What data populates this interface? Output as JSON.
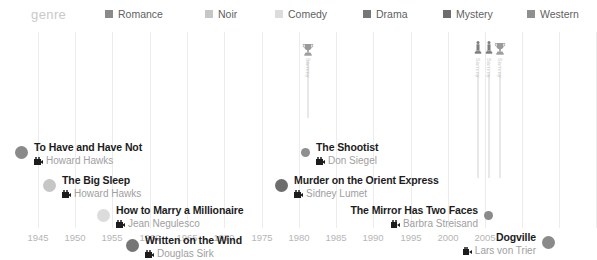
{
  "legend": {
    "title": "genre",
    "items": [
      {
        "label": "Romance",
        "color": "#8a8a8a",
        "x": 105
      },
      {
        "label": "Noir",
        "color": "#c6c6c6",
        "x": 205
      },
      {
        "label": "Comedy",
        "color": "#dcdcdc",
        "x": 275
      },
      {
        "label": "Drama",
        "color": "#767676",
        "x": 363
      },
      {
        "label": "Mystery",
        "color": "#6d6d6d",
        "x": 443
      },
      {
        "label": "Western",
        "color": "#8f8f8f",
        "x": 527
      }
    ]
  },
  "axis": {
    "ticks": [
      {
        "label": "1945",
        "x": 38
      },
      {
        "label": "1950",
        "x": 75
      },
      {
        "label": "1955",
        "x": 112
      },
      {
        "label": "1960",
        "x": 150
      },
      {
        "label": "1965",
        "x": 187
      },
      {
        "label": "1970",
        "x": 224
      },
      {
        "label": "1975",
        "x": 262
      },
      {
        "label": "1980",
        "x": 299
      },
      {
        "label": "1985",
        "x": 336
      },
      {
        "label": "1990",
        "x": 373
      },
      {
        "label": "1995",
        "x": 411
      },
      {
        "label": "2000",
        "x": 448
      },
      {
        "label": "2005",
        "x": 485
      }
    ],
    "gridlines": [
      38,
      75,
      112,
      150,
      187,
      224,
      262,
      299,
      336,
      373,
      411,
      448,
      485,
      522,
      559,
      596
    ],
    "range": [
      1945,
      2005
    ]
  },
  "chart_data": {
    "type": "scatter",
    "title": "",
    "xlabel": "",
    "ylabel": "",
    "xlim": [
      1945,
      2005
    ],
    "grid": true,
    "legend_position": "top",
    "films": [
      {
        "title": "To Have and Have Not",
        "director": "Howard Hawks",
        "year": 1944,
        "genre": "Romance",
        "color": "#8a8a8a",
        "dot_x": 22,
        "dot_y": 117,
        "label_side": "right",
        "dot_size": "large"
      },
      {
        "title": "The Big Sleep",
        "director": "Howard Hawks",
        "year": 1946,
        "genre": "Noir",
        "color": "#c6c6c6",
        "dot_x": 50,
        "dot_y": 150,
        "label_side": "right",
        "dot_size": "large"
      },
      {
        "title": "How to Marry a Millionaire",
        "director": "Jean Negulesco",
        "year": 1953,
        "genre": "Comedy",
        "color": "#dcdcdc",
        "dot_x": 104,
        "dot_y": 180,
        "label_side": "right",
        "dot_size": "large"
      },
      {
        "title": "Written on the Wind",
        "director": "Douglas Sirk",
        "year": 1956,
        "genre": "Drama",
        "color": "#767676",
        "dot_x": 133,
        "dot_y": 210,
        "label_side": "right",
        "dot_size": "large"
      },
      {
        "title": "The Shootist",
        "director": "Don Siegel",
        "year": 1976,
        "genre": "Western",
        "color": "#8f8f8f",
        "dot_x": 308,
        "dot_y": 117,
        "label_side": "right",
        "dot_size": "small"
      },
      {
        "title": "Murder on the Orient Express",
        "director": "Sidney Lumet",
        "year": 1974,
        "genre": "Mystery",
        "color": "#6d6d6d",
        "dot_x": 282,
        "dot_y": 150,
        "label_side": "right",
        "dot_size": "large"
      },
      {
        "title": "The Mirror Has Two Faces",
        "director": "Barbra Streisand",
        "year": 1996,
        "genre": "Romance",
        "color": "#8a8a8a",
        "dot_x": 486,
        "dot_y": 180,
        "label_side": "left",
        "dot_size": "small"
      },
      {
        "title": "Dogville",
        "director": "Lars von Trier",
        "year": 2003,
        "genre": "Drama",
        "color": "#8a8a8a",
        "dot_x": 548,
        "dot_y": 207,
        "label_side": "left",
        "dot_size": "large"
      }
    ],
    "awards": [
      {
        "icon": "trophy",
        "label": "Sammy",
        "x": 308,
        "icon_top": 10,
        "text_top": 26,
        "stem_top": 28,
        "stem_height": 58
      },
      {
        "icon": "statuette",
        "label": "Sammy",
        "x": 478,
        "icon_top": 8,
        "text_top": 26,
        "stem_top": 42,
        "stem_height": 104
      },
      {
        "icon": "statuette",
        "label": "Sammy",
        "x": 489,
        "icon_top": 8,
        "text_top": 26,
        "stem_top": 42,
        "stem_height": 104
      },
      {
        "icon": "trophy",
        "label": "Sammy",
        "x": 500,
        "icon_top": 9,
        "text_top": 26,
        "stem_top": 42,
        "stem_height": 104
      }
    ]
  }
}
